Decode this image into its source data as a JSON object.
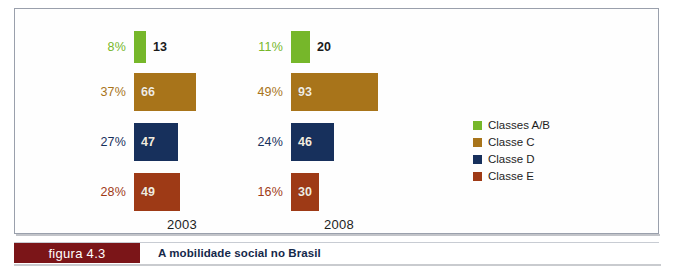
{
  "figure": {
    "tag": "figura 4.3",
    "caption": "A mobilidade social no Brasil"
  },
  "colors": {
    "classes_ab": "#76b72a",
    "classe_c": "#a8741a",
    "classe_d": "#17305c",
    "classe_e": "#9e3a16",
    "caption_bar": "#7b1518",
    "caption_text": "#15284a",
    "frame_border": "#9aa0ac"
  },
  "legend": {
    "items": [
      {
        "label": "Classes A/B",
        "color": "#76b72a"
      },
      {
        "label": "Classe C",
        "color": "#a8741a"
      },
      {
        "label": "Classe D",
        "color": "#17305c"
      },
      {
        "label": "Classe E",
        "color": "#9e3a16"
      }
    ]
  },
  "chart_data": {
    "type": "bar",
    "orientation": "horizontal",
    "title": "A mobilidade social no Brasil",
    "xlabel": "",
    "ylabel": "",
    "grid": false,
    "legend_position": "right",
    "categories": [
      "Classes A/B",
      "Classe C",
      "Classe D",
      "Classe E"
    ],
    "groups": [
      "2003",
      "2008"
    ],
    "series": [
      {
        "name": "2003",
        "values": [
          13,
          66,
          47,
          49
        ],
        "percents": [
          "8%",
          "37%",
          "27%",
          "28%"
        ],
        "value_labels": [
          "13",
          "66",
          "47",
          "49"
        ]
      },
      {
        "name": "2008",
        "values": [
          20,
          93,
          46,
          30
        ],
        "percents": [
          "11%",
          "49%",
          "24%",
          "16%"
        ],
        "value_labels": [
          "20",
          "93",
          "46",
          "30"
        ]
      }
    ],
    "units": "millions of people",
    "px_per_unit": 0.94
  }
}
